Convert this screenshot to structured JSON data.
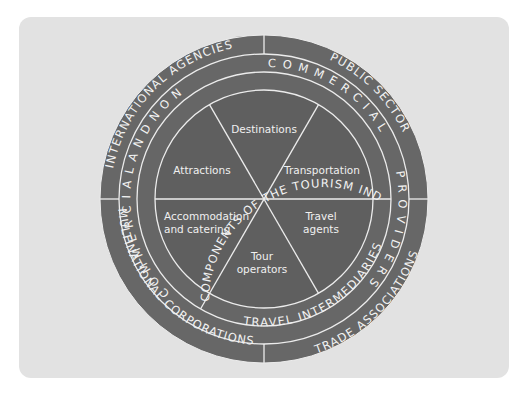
{
  "diagram": {
    "title": "Components of the tourism industry",
    "colors": {
      "panel_bg": "#e2e2e2",
      "ring_fill": "#676767",
      "inner_fill": "#5f5f5f",
      "line": "#ececec",
      "text": "#f2f2f2"
    },
    "outer_ring": {
      "top_left": "INTERNATIONAL AGENCIES",
      "top_right": "PUBLIC SECTOR",
      "bottom_right": "TRADE ASSOCIATIONS",
      "bottom_left": "MULTINATIONAL CORPORATIONS"
    },
    "middle_ring": {
      "left": "C O M M E R C I A L   A N D   N O N",
      "dash": "-",
      "top_right": "C O M M E R C I A L",
      "right": "P R O V I D E R S"
    },
    "inner_ring": {
      "core": "CORE COMPONENTS OF THE TOURISM INDUSTRY",
      "intermediaries": "TRAVEL INTERMEDIARIES"
    },
    "segments": [
      {
        "name": "destinations",
        "lines": [
          "Destinations"
        ]
      },
      {
        "name": "transportation",
        "lines": [
          "Transportation"
        ]
      },
      {
        "name": "travel-agents",
        "lines": [
          "Travel",
          "agents"
        ]
      },
      {
        "name": "tour-operators",
        "lines": [
          "Tour",
          "operators"
        ]
      },
      {
        "name": "accommodation-catering",
        "lines": [
          "Accommodation",
          "and catering"
        ]
      },
      {
        "name": "attractions",
        "lines": [
          "Attractions"
        ]
      }
    ]
  }
}
